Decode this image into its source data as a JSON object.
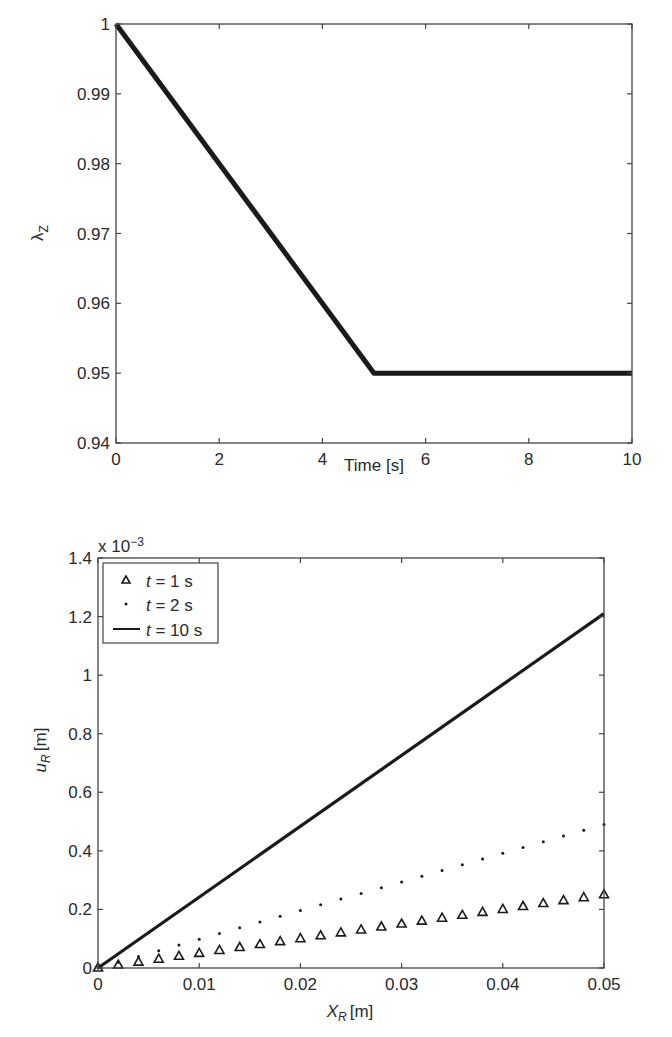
{
  "chart_data": [
    {
      "type": "line",
      "title": "",
      "xlabel": "Time [s]",
      "ylabel": "λZ",
      "ylabel_main": "λ",
      "ylabel_sub": "Z",
      "xlim": [
        0,
        10
      ],
      "ylim": [
        0.94,
        1.0
      ],
      "grid": false,
      "xticks": [
        0,
        2,
        4,
        6,
        8,
        10
      ],
      "xtick_labels": [
        "0",
        "2",
        "4",
        "6",
        "8",
        "10"
      ],
      "yticks": [
        0.94,
        0.95,
        0.96,
        0.97,
        0.98,
        0.99,
        1.0
      ],
      "ytick_labels": [
        "0.94",
        "0.95",
        "0.96",
        "0.97",
        "0.98",
        "0.99",
        "1"
      ],
      "series": [
        {
          "name": "λZ",
          "style": "thick-line",
          "color": "#1a1a1a",
          "x": [
            0,
            5,
            10
          ],
          "y": [
            1.0,
            0.95,
            0.95
          ]
        }
      ],
      "legend": null
    },
    {
      "type": "line",
      "title": "",
      "xlabel": "XR [m]",
      "xlabel_main": "X",
      "xlabel_sub": "R",
      "xlabel_unit": "[m]",
      "ylabel": "uR [m]",
      "ylabel_main": "u",
      "ylabel_sub": "R",
      "ylabel_unit": "[m]",
      "y_multiplier": "x 10",
      "y_multiplier_exp": "−3",
      "xlim": [
        0,
        0.05
      ],
      "ylim": [
        0,
        1.4
      ],
      "grid": false,
      "xticks": [
        0,
        0.01,
        0.02,
        0.03,
        0.04,
        0.05
      ],
      "xtick_labels": [
        "0",
        "0.01",
        "0.02",
        "0.03",
        "0.04",
        "0.05"
      ],
      "yticks": [
        0,
        0.2,
        0.4,
        0.6,
        0.8,
        1.0,
        1.2,
        1.4
      ],
      "ytick_labels": [
        "0",
        "0.2",
        "0.4",
        "0.6",
        "0.8",
        "1",
        "1.2",
        "1.4"
      ],
      "legend_position": "upper left",
      "series": [
        {
          "name": "t = 1 s",
          "legend_var": "t",
          "legend_rest": " = 1 s",
          "marker": "triangle",
          "color": "#1a1a1a",
          "x": [
            0,
            0.002,
            0.004,
            0.006,
            0.008,
            0.01,
            0.012,
            0.014,
            0.016,
            0.018,
            0.02,
            0.022,
            0.024,
            0.026,
            0.028,
            0.03,
            0.032,
            0.034,
            0.036,
            0.038,
            0.04,
            0.042,
            0.044,
            0.046,
            0.048,
            0.05
          ],
          "y": [
            0,
            0.01,
            0.02,
            0.03,
            0.04,
            0.05,
            0.06,
            0.07,
            0.08,
            0.09,
            0.1,
            0.11,
            0.12,
            0.13,
            0.14,
            0.15,
            0.16,
            0.17,
            0.18,
            0.19,
            0.2,
            0.21,
            0.22,
            0.23,
            0.24,
            0.25
          ]
        },
        {
          "name": "t = 2 s",
          "legend_var": "t",
          "legend_rest": " = 2 s",
          "marker": "dot",
          "color": "#1a1a1a",
          "x": [
            0,
            0.002,
            0.004,
            0.006,
            0.008,
            0.01,
            0.012,
            0.014,
            0.016,
            0.018,
            0.02,
            0.022,
            0.024,
            0.026,
            0.028,
            0.03,
            0.032,
            0.034,
            0.036,
            0.038,
            0.04,
            0.042,
            0.044,
            0.046,
            0.048,
            0.05
          ],
          "y": [
            0,
            0.0196,
            0.0392,
            0.0588,
            0.0784,
            0.098,
            0.1176,
            0.1372,
            0.1568,
            0.1764,
            0.196,
            0.2156,
            0.2352,
            0.2548,
            0.2744,
            0.294,
            0.3136,
            0.3332,
            0.3528,
            0.3724,
            0.392,
            0.4116,
            0.4312,
            0.4508,
            0.4704,
            0.49
          ]
        },
        {
          "name": "t = 10 s",
          "legend_var": "t",
          "legend_rest": " = 10 s",
          "marker": "line",
          "color": "#1a1a1a",
          "x": [
            0,
            0.05
          ],
          "y": [
            0,
            1.21
          ]
        }
      ]
    }
  ]
}
